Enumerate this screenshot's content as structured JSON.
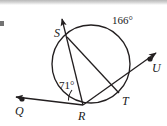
{
  "figure": {
    "type": "geometry-diagram",
    "width": 167,
    "height": 126,
    "background_color": "#ffffff",
    "stroke_color": "#231f20"
  },
  "circle": {
    "name": "main-circle",
    "center_x": 91,
    "center_y": 64,
    "radius": 39,
    "stroke_color": "#231f20",
    "stroke_width": 1.3
  },
  "points": [
    {
      "id": "S",
      "label": "S",
      "x": 67,
      "y": 37,
      "label_x": 54,
      "label_y": 27,
      "on_circle": true,
      "dot": false
    },
    {
      "id": "T",
      "label": "T",
      "x": 119,
      "y": 93,
      "label_x": 122,
      "label_y": 96,
      "on_circle": true,
      "dot": false
    },
    {
      "id": "R",
      "label": "R",
      "x": 83,
      "y": 105,
      "label_x": 78,
      "label_y": 110,
      "on_circle": true,
      "dot": false
    },
    {
      "id": "Q",
      "label": "Q",
      "x": 21,
      "y": 99,
      "label_x": 15,
      "label_y": 106,
      "on_circle": false,
      "dot": true
    },
    {
      "id": "U",
      "label": "U",
      "x": 151,
      "y": 58,
      "label_x": 152,
      "label_y": 63,
      "on_circle": false,
      "dot": true
    }
  ],
  "segments": [
    {
      "name": "ray-R-to-Q",
      "from": "R",
      "to": "Q",
      "arrow_at_end": true
    },
    {
      "name": "ray-R-to-U",
      "from": "R",
      "to": "U",
      "arrow_at_end": true,
      "passes_through": "T"
    },
    {
      "name": "ray-R-to-S",
      "from": "R",
      "to": "S",
      "arrow_at_end": true,
      "extends_beyond": "S"
    },
    {
      "name": "chord-S-to-T",
      "from": "S",
      "to": "T",
      "arrow_at_end": false
    }
  ],
  "angles": [
    {
      "name": "angle-at-R",
      "label": "71°",
      "value": 71,
      "unit": "degrees",
      "vertex": "R",
      "label_x": 62,
      "label_y": 83,
      "arc": true
    },
    {
      "name": "arc-S-to-T-major",
      "label": "166°",
      "value": 166,
      "unit": "degrees",
      "arc_endpoints": [
        "S",
        "T"
      ],
      "label_x": 114,
      "label_y": 18,
      "arc": false
    }
  ],
  "labels": {
    "point_S": "S",
    "point_T": "T",
    "point_R": "R",
    "point_Q": "Q",
    "point_U": "U",
    "angle_R": "71°",
    "arc_ST": "166°"
  }
}
